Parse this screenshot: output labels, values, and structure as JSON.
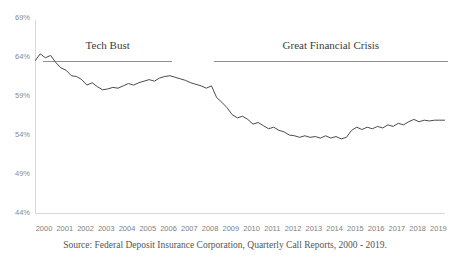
{
  "header": {
    "clipped_title": ""
  },
  "source_note": "Source: Federal Deposit Insurance Corporation, Quarterly Call Reports, 2000 - 2019.",
  "annotations": [
    {
      "label": "Tech Bust",
      "x_start": 2000.4,
      "x_end": 2006.6
    },
    {
      "label": "Great Financial Crisis",
      "x_start": 2008.6,
      "x_end": 2019.9
    }
  ],
  "style": {
    "line_color": "#4b4b4b",
    "axis_color": "#d8d8d8",
    "tick_text_color": "#8a8a8a",
    "annotation_color": "#3d3d3d",
    "annotation_rule_color": "#8f8f8f",
    "background": "#ffffff"
  },
  "chart_data": {
    "type": "line",
    "title": "",
    "xlabel": "",
    "ylabel": "",
    "ylim": [
      44,
      69
    ],
    "xlim": [
      2000,
      2019.75
    ],
    "grid": false,
    "legend": false,
    "y_tick_labels": [
      "69%",
      "64%",
      "59%",
      "54%",
      "49%",
      "44%"
    ],
    "y_ticks": [
      69,
      64,
      59,
      54,
      49,
      44
    ],
    "x_tick_labels": [
      "2000",
      "2001",
      "2002",
      "2003",
      "2004",
      "2005",
      "2006",
      "2007",
      "2008",
      "2009",
      "2010",
      "2011",
      "2012",
      "2013",
      "2014",
      "2015",
      "2016",
      "2017",
      "2018",
      "2019"
    ],
    "x_ticks": [
      2000,
      2001,
      2002,
      2003,
      2004,
      2005,
      2006,
      2007,
      2008,
      2009,
      2010,
      2011,
      2012,
      2013,
      2014,
      2015,
      2016,
      2017,
      2018,
      2019
    ],
    "series": [
      {
        "name": "Loans to Deposits Ratio",
        "x": [
          2000.0,
          2000.25,
          2000.5,
          2000.75,
          2001.0,
          2001.25,
          2001.5,
          2001.75,
          2002.0,
          2002.25,
          2002.5,
          2002.75,
          2003.0,
          2003.25,
          2003.5,
          2003.75,
          2004.0,
          2004.25,
          2004.5,
          2004.75,
          2005.0,
          2005.25,
          2005.5,
          2005.75,
          2006.0,
          2006.25,
          2006.5,
          2006.75,
          2007.0,
          2007.25,
          2007.5,
          2007.75,
          2008.0,
          2008.25,
          2008.5,
          2008.75,
          2009.0,
          2009.25,
          2009.5,
          2009.75,
          2010.0,
          2010.25,
          2010.5,
          2010.75,
          2011.0,
          2011.25,
          2011.5,
          2011.75,
          2012.0,
          2012.25,
          2012.5,
          2012.75,
          2013.0,
          2013.25,
          2013.5,
          2013.75,
          2014.0,
          2014.25,
          2014.5,
          2014.75,
          2015.0,
          2015.25,
          2015.5,
          2015.75,
          2016.0,
          2016.25,
          2016.5,
          2016.75,
          2017.0,
          2017.25,
          2017.5,
          2017.75,
          2018.0,
          2018.25,
          2018.5,
          2018.75,
          2019.0,
          2019.25,
          2019.5,
          2019.75
        ],
        "values": [
          63.5,
          64.4,
          63.9,
          64.2,
          63.3,
          62.6,
          62.3,
          61.6,
          61.5,
          61.1,
          60.4,
          60.7,
          60.2,
          59.8,
          59.9,
          60.1,
          60.0,
          60.3,
          60.6,
          60.4,
          60.7,
          60.9,
          61.1,
          60.9,
          61.3,
          61.5,
          61.6,
          61.4,
          61.2,
          61.0,
          60.7,
          60.5,
          60.3,
          60.0,
          60.3,
          58.8,
          58.2,
          57.5,
          56.6,
          56.2,
          56.4,
          56.0,
          55.4,
          55.6,
          55.2,
          54.8,
          55.0,
          54.6,
          54.4,
          54.0,
          53.9,
          53.7,
          53.9,
          53.7,
          53.8,
          53.6,
          53.9,
          53.6,
          53.8,
          53.5,
          53.7,
          54.6,
          55.0,
          54.7,
          55.0,
          54.8,
          55.1,
          54.9,
          55.3,
          55.1,
          55.5,
          55.3,
          55.7,
          56.0,
          55.7,
          55.9,
          55.8,
          55.9,
          55.9,
          55.9
        ]
      }
    ]
  }
}
